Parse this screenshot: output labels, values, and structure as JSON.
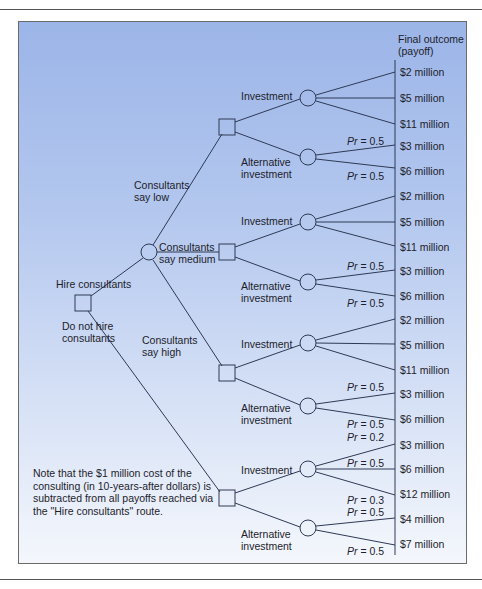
{
  "header": {
    "outcome_title": "Final outcome",
    "outcome_subtitle": "(payoff)"
  },
  "branches": {
    "hire": "Hire consultants",
    "no_hire": "Do not hire consultants",
    "say_low": "Consultants say low",
    "say_medium": "Consultants say medium",
    "say_high": "Consultants say high",
    "investment": "Investment",
    "alternative": "Alternative investment"
  },
  "outcomes": [
    "$2 million",
    "$5 million",
    "$11 million",
    "$3 million",
    "$6 million",
    "$2 million",
    "$5 million",
    "$11 million",
    "$3 million",
    "$6 million",
    "$2 million",
    "$5 million",
    "$11 million",
    "$3 million",
    "$6 million",
    "$3 million",
    "$6 million",
    "$12 million",
    "$4 million",
    "$7 million"
  ],
  "probabilities": {
    "low_alt_up": "0.5",
    "low_alt_down": "0.5",
    "med_alt_up": "0.5",
    "med_alt_down": "0.5",
    "high_alt_up": "0.5",
    "high_alt_down": "0.5",
    "nohire_inv_1": "0.2",
    "nohire_inv_2": "0.5",
    "nohire_inv_3": "0.3",
    "nohire_alt_up": "0.5",
    "nohire_alt_down": "0.5"
  },
  "pr_label": "Pr",
  "note": "Note that the $1 million cost of the consulting (in 10-years-after dollars) is subtracted from all payoffs reached via the \"Hire consultants\" route.",
  "colors": {
    "panel_top": "#9cb5e8",
    "panel_bottom": "#f4f7fc",
    "line": "#2e3a55"
  }
}
